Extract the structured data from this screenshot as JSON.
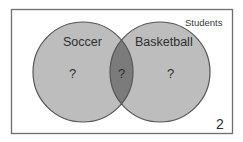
{
  "diagram": {
    "type": "venn",
    "universe": {
      "label": "Students",
      "outside_value": "2"
    },
    "sets": [
      {
        "name": "Soccer",
        "only_value": "?"
      },
      {
        "name": "Basketball",
        "only_value": "?"
      }
    ],
    "intersection": {
      "value": "?"
    },
    "colors": {
      "circle_fill": "#bdbdbd",
      "intersection_fill": "#7b7b7b",
      "outline": "#555555",
      "frame": "#6e6e6e",
      "background": "#ffffff",
      "text": "#2f2f2f"
    }
  }
}
